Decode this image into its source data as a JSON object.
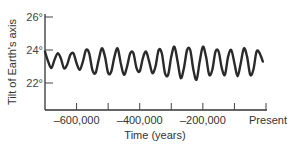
{
  "chart_data": {
    "type": "line",
    "title": "",
    "xlabel": "Time (years)",
    "ylabel": "Tilt of Earth's axis",
    "xlim": [
      -700000,
      0
    ],
    "ylim": [
      21,
      26.5
    ],
    "x_ticks": [
      -700000,
      -600000,
      -500000,
      -400000,
      -300000,
      -200000,
      -100000,
      0
    ],
    "x_tick_labels": [
      {
        "value": -600000,
        "label": "–600,000"
      },
      {
        "value": -400000,
        "label": "–400,000"
      },
      {
        "value": -200000,
        "label": "–200,000"
      },
      {
        "value": 0,
        "label": "Present"
      }
    ],
    "y_ticks": [
      22,
      24,
      26
    ],
    "y_tick_labels": [
      "22°",
      "24°",
      "26°"
    ],
    "grid": false,
    "legend": null,
    "series": [
      {
        "name": "Axial tilt (obliquity)",
        "period_years": 41000,
        "x": [
          -700000,
          -690000,
          -680000,
          -670000,
          -660000,
          -650000,
          -640000,
          -630000,
          -620000,
          -610000,
          -600000,
          -590000,
          -580000,
          -570000,
          -560000,
          -550000,
          -540000,
          -530000,
          -520000,
          -510000,
          -500000,
          -490000,
          -480000,
          -470000,
          -460000,
          -450000,
          -440000,
          -430000,
          -420000,
          -410000,
          -400000,
          -390000,
          -380000,
          -370000,
          -360000,
          -350000,
          -340000,
          -330000,
          -320000,
          -310000,
          -300000,
          -290000,
          -280000,
          -270000,
          -260000,
          -250000,
          -240000,
          -230000,
          -220000,
          -210000,
          -200000,
          -190000,
          -180000,
          -170000,
          -160000,
          -150000,
          -140000,
          -130000,
          -120000,
          -110000,
          -100000,
          -90000,
          -80000,
          -70000,
          -60000,
          -50000,
          -40000,
          -30000,
          -20000,
          -10000
        ],
        "values": [
          23.9,
          23.3,
          22.9,
          23.4,
          23.8,
          23.5,
          22.9,
          23.1,
          23.7,
          23.8,
          23.2,
          22.8,
          23.3,
          24.0,
          23.8,
          22.8,
          22.6,
          23.4,
          24.1,
          23.6,
          22.6,
          22.7,
          23.6,
          24.1,
          23.2,
          22.5,
          23.0,
          23.8,
          23.8,
          22.9,
          22.7,
          23.5,
          23.9,
          23.3,
          22.6,
          23.0,
          24.0,
          23.8,
          22.6,
          22.5,
          23.6,
          24.2,
          23.3,
          22.3,
          22.9,
          24.0,
          24.0,
          22.8,
          22.2,
          23.3,
          24.2,
          23.6,
          22.5,
          22.8,
          23.9,
          23.9,
          22.9,
          22.5,
          23.6,
          24.0,
          23.2,
          22.4,
          23.2,
          24.1,
          23.6,
          22.5,
          22.8,
          23.9,
          23.8,
          23.3
        ]
      }
    ]
  }
}
